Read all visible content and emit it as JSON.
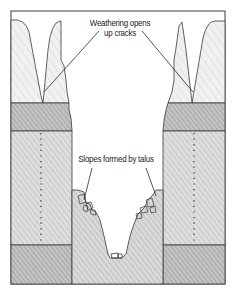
{
  "diagram": {
    "type": "geological cross-section",
    "labels": {
      "weathering_line1": "Weathering opens",
      "weathering_line2": "up cracks",
      "talus": "Slopes formed by talus"
    },
    "layers": [
      {
        "name": "upper-weathered-rock",
        "shade": "light",
        "color": "#e9e9e9"
      },
      {
        "name": "dark-band-upper",
        "shade": "dark",
        "color": "#b5b5b5"
      },
      {
        "name": "middle-rock-with-joint",
        "shade": "medium",
        "color": "#d6d6d6"
      },
      {
        "name": "dark-band-lower",
        "shade": "dark",
        "color": "#bdbdbd"
      }
    ],
    "colors": {
      "outline": "#3a3a3a",
      "hatch": "#9a9a9a",
      "background": "#ffffff",
      "text": "#1c1c1c"
    }
  }
}
